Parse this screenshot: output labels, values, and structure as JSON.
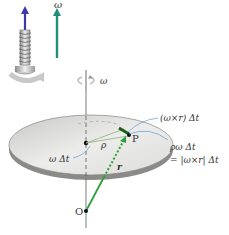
{
  "figure": {
    "omega_vector_label": "ω",
    "rotation_indicator_label": "ω",
    "point_P_label": "P",
    "origin_label": "O",
    "rho_label": "ρ",
    "r_label": "r",
    "angle_label": "ω Δt",
    "cross_product_label": "(ω×r) Δt",
    "displacement_label_line1": "ρω Δt",
    "displacement_label_line2": "= |ω×r| Δt"
  },
  "colors": {
    "omega_arrow": "#1f8f7a",
    "screw_arrow": "#3a3aa8",
    "r_vector": "#2e9e3a",
    "disk_top": "#d9d9d6",
    "disk_edge": "#8a8a88",
    "callout_lines": "#5b9bd5",
    "text": "#333333"
  }
}
